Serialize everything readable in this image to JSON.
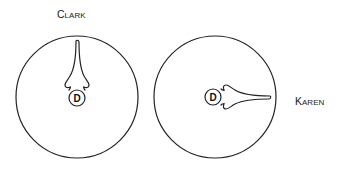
{
  "diagram": {
    "type": "field-diagram",
    "colors": {
      "stroke": "#222222",
      "background": "#ffffff",
      "text": "#1a1a1a"
    },
    "panels": [
      {
        "name": "Clark",
        "label_initial": "C",
        "label_rest": "LARK",
        "center_marker": "D",
        "orientation": "up",
        "circle": {
          "cx": 77,
          "cy": 97,
          "r": 61
        }
      },
      {
        "name": "Karen",
        "label_initial": "K",
        "label_rest": "AREN",
        "center_marker": "D",
        "orientation": "right",
        "circle": {
          "cx": 215,
          "cy": 97,
          "r": 61
        }
      }
    ]
  }
}
